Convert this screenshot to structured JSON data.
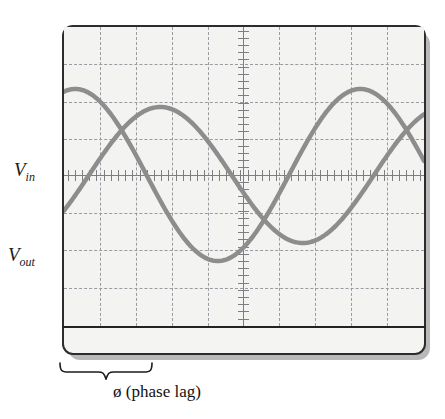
{
  "figure": {
    "kind": "oscilloscope-screen-illustration",
    "caption": "ø (phase lag)",
    "labels": {
      "vin_main": "V",
      "vin_sub": "in",
      "vout_main": "V",
      "vout_sub": "out"
    },
    "colors": {
      "trace": "#8d8d8d",
      "grid": "#9a9aa0",
      "axis": "#7d7d83",
      "bezel": "#2c2c2c",
      "screen_bg": "#f3f3f1",
      "body_bg": "#f4f4f2",
      "shadow": "#b9b9b9",
      "text": "#1a1a1a"
    }
  },
  "chart_data": {
    "type": "line",
    "title": "",
    "xlabel": "",
    "ylabel": "",
    "grid": true,
    "legend": "inline-left-labels",
    "xlim": [
      0,
      360
    ],
    "ylim": [
      -1.35,
      1.35
    ],
    "graticule": {
      "vertical_gridlines_px": [
        36,
        72,
        108,
        144,
        179,
        215,
        251,
        287,
        323
      ],
      "horizontal_gridlines_px": [
        37,
        75,
        112,
        186,
        223,
        261
      ],
      "center_axis_x_px": 179,
      "center_axis_y_px": 148,
      "tick_spacing_px": 7.2
    },
    "series": [
      {
        "name": "V_in",
        "label": "V in",
        "color": "#8d8d8d",
        "amplitude": 1.0,
        "period_px": 285,
        "phase_offset_px": -60,
        "baseline_px": 148,
        "amplitude_px": 86,
        "peak_px": [
          145,
          63
        ],
        "trough_px": [
          335,
          285
        ],
        "linewidth": 4.5
      },
      {
        "name": "V_out",
        "label": "V out",
        "color": "#8d8d8d",
        "amplitude": 0.78,
        "period_px": 285,
        "phase_offset_px": 25,
        "baseline_px": 148,
        "amplitude_px": 68,
        "peak_px": [
          230,
          90
        ],
        "trough_px": [
          372,
          268
        ],
        "linewidth": 4.5
      }
    ],
    "annotations": [
      {
        "name": "phase-lag-brace",
        "text": "ø (phase lag)",
        "span_px": [
          62,
          150
        ],
        "position": "below-scope"
      }
    ]
  }
}
